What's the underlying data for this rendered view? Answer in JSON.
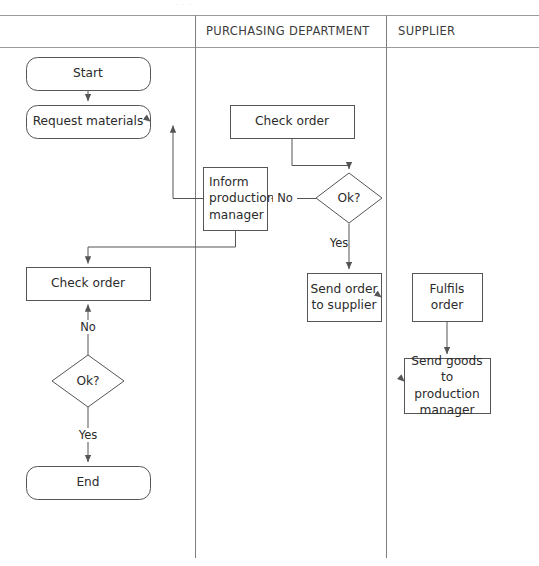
{
  "diagram": {
    "type": "cross-functional-flowchart",
    "stroke_color": "#555555",
    "lane_border_color": "#8a8a8a",
    "text_color": "#2b2b2b",
    "background": "#ffffff",
    "lanes": [
      {
        "id": "lane-left",
        "label": "",
        "x_start": 0,
        "x_end": 195
      },
      {
        "id": "lane-purchasing",
        "label": "PURCHASING DEPARTMENT",
        "x_start": 195,
        "x_end": 386
      },
      {
        "id": "lane-supplier",
        "label": "SUPPLIER",
        "x_start": 386,
        "x_end": 539
      }
    ],
    "nodes": [
      {
        "id": "start",
        "label": "Start",
        "shape": "rounded",
        "lane": "lane-left",
        "x": 26,
        "y": 57,
        "w": 124,
        "h": 33
      },
      {
        "id": "request-materials",
        "label": "Request materials",
        "shape": "rounded",
        "lane": "lane-left",
        "x": 26,
        "y": 105,
        "w": 124,
        "h": 33
      },
      {
        "id": "check-order-left",
        "label": "Check order",
        "shape": "rect",
        "lane": "lane-left",
        "x": 26,
        "y": 267,
        "w": 124,
        "h": 33
      },
      {
        "id": "ok-left",
        "label": "Ok?",
        "shape": "diamond",
        "lane": "lane-left",
        "x": 52,
        "y": 355,
        "w": 72,
        "h": 52
      },
      {
        "id": "end",
        "label": "End",
        "shape": "rounded",
        "lane": "lane-left",
        "x": 26,
        "y": 466,
        "w": 124,
        "h": 33
      },
      {
        "id": "check-order-pur",
        "label": "Check order",
        "shape": "rect",
        "lane": "lane-purchasing",
        "x": 230,
        "y": 105,
        "w": 124,
        "h": 33
      },
      {
        "id": "inform-production",
        "label": "Inform\nproduction\nmanager",
        "shape": "rect",
        "lane": "lane-purchasing",
        "x": 203,
        "y": 167,
        "w": 64,
        "h": 63
      },
      {
        "id": "ok-purchasing",
        "label": "Ok?",
        "shape": "diamond",
        "lane": "lane-purchasing",
        "x": 316,
        "y": 173,
        "w": 66,
        "h": 50
      },
      {
        "id": "send-order",
        "label": "Send order\nto supplier",
        "shape": "rect",
        "lane": "lane-purchasing",
        "x": 307,
        "y": 273,
        "w": 74,
        "h": 48
      },
      {
        "id": "fulfils-order",
        "label": "Fulfils\norder",
        "shape": "rect",
        "lane": "lane-supplier",
        "x": 412,
        "y": 273,
        "w": 70,
        "h": 48
      },
      {
        "id": "send-goods",
        "label": "Send goods to\nproduction\nmanager",
        "shape": "rect",
        "lane": "lane-supplier",
        "x": 404,
        "y": 358,
        "w": 86,
        "h": 55
      }
    ],
    "edge_labels": [
      {
        "id": "edge-label-no-purchasing",
        "text": "No",
        "x": 281,
        "y": 191
      },
      {
        "id": "edge-label-yes-purchasing",
        "text": "Yes",
        "x": 338,
        "y": 243
      },
      {
        "id": "edge-label-no-left",
        "text": "No",
        "x": 88,
        "y": 327
      },
      {
        "id": "edge-label-yes-left",
        "text": "Yes",
        "x": 88,
        "y": 434
      }
    ],
    "edges": [
      {
        "from": "start",
        "to": "request-materials",
        "label": ""
      },
      {
        "from": "request-materials",
        "to": "check-order-pur",
        "label": ""
      },
      {
        "from": "check-order-pur",
        "to": "ok-purchasing",
        "label": ""
      },
      {
        "from": "ok-purchasing",
        "to": "inform-production",
        "label": "No"
      },
      {
        "from": "ok-purchasing",
        "to": "send-order",
        "label": "Yes"
      },
      {
        "from": "inform-production",
        "to": "request-materials",
        "label": ""
      },
      {
        "from": "inform-production",
        "to": "check-order-left",
        "label": ""
      },
      {
        "from": "send-order",
        "to": "fulfils-order",
        "label": ""
      },
      {
        "from": "fulfils-order",
        "to": "send-goods",
        "label": ""
      },
      {
        "from": "send-goods",
        "to": "ok-left",
        "label": ""
      },
      {
        "from": "ok-left",
        "to": "check-order-left",
        "label": "No"
      },
      {
        "from": "ok-left",
        "to": "end",
        "label": "Yes"
      }
    ]
  }
}
